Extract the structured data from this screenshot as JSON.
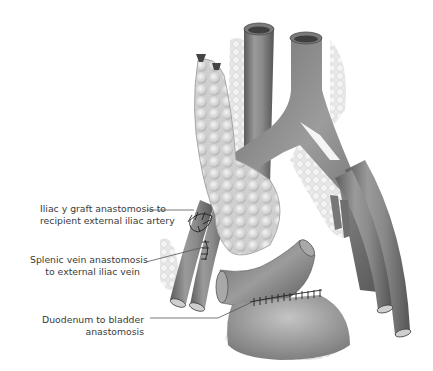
{
  "figure": {
    "labels": [
      {
        "id": "iliac-graft",
        "lines": [
          "Iliac y graft anastomosis to",
          "recipient external iliac artery"
        ]
      },
      {
        "id": "splenic-vein",
        "lines": [
          "Splenic vein anastomosis",
          "to external iliac vein"
        ]
      },
      {
        "id": "duodenum-bladder",
        "lines": [
          "Duodenum to bladder",
          "anastomosis"
        ]
      }
    ],
    "colors": {
      "vessel": "#8a8a8a",
      "vessel_dark": "#5e5e5e",
      "vessel_light": "#b5b5b5",
      "pancreas": "#d9d9d9",
      "fat": "#e6e6e6",
      "suture": "#2a2a2a",
      "leader_line": "#555555",
      "text": "#3a3a3a"
    }
  }
}
